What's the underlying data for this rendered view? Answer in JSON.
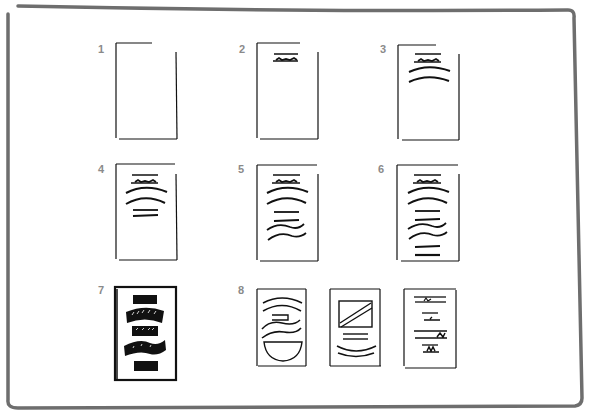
{
  "diagram": {
    "frame_color": "#6e6e6e",
    "ink_color": "#111111",
    "label_color": "#8a8a8a",
    "steps": [
      {
        "label": "1",
        "description": "empty page"
      },
      {
        "label": "2",
        "description": "page with title bar"
      },
      {
        "label": "3",
        "description": "title bar plus two arched lines"
      },
      {
        "label": "4",
        "description": "title, two arcs, two short lines"
      },
      {
        "label": "5",
        "description": "title, two arcs, two lines, two wavy lines"
      },
      {
        "label": "6",
        "description": "title, arcs, lines, waves, two bottom lines"
      },
      {
        "label": "7",
        "description": "inverted heavy black banners"
      },
      {
        "label": "8",
        "description": "three alternative layout variations"
      }
    ]
  }
}
